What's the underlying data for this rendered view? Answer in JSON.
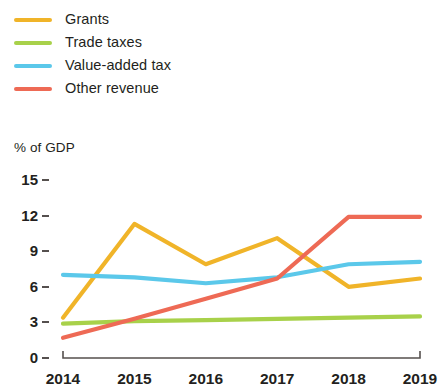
{
  "legend": {
    "position": "top-left",
    "items": [
      {
        "label": "Grants",
        "color": "#f0b429",
        "key": "grants"
      },
      {
        "label": "Trade taxes",
        "color": "#a8d14a",
        "key": "trade_taxes"
      },
      {
        "label": "Value-added tax",
        "color": "#5bc8ea",
        "key": "vat"
      },
      {
        "label": "Other revenue",
        "color": "#ee6a55",
        "key": "other_revenue"
      }
    ]
  },
  "axis": {
    "y_title": "% of GDP",
    "y_ticks": [
      "15",
      "12",
      "9",
      "6",
      "3",
      "0"
    ],
    "x_ticks": [
      "2014",
      "2015",
      "2016",
      "2017",
      "2018",
      "2019"
    ]
  },
  "chart_data": {
    "type": "line",
    "title": "",
    "subtitle": "",
    "xlabel": "",
    "ylabel": "% of GDP",
    "x": [
      "2014",
      "2015",
      "2016",
      "2017",
      "2018",
      "2019"
    ],
    "categories": [
      "2014",
      "2015",
      "2016",
      "2017",
      "2018",
      "2019"
    ],
    "ylim": [
      0,
      15
    ],
    "ytick_values": [
      0,
      3,
      6,
      9,
      12,
      15
    ],
    "grid": false,
    "legend_position": "top-left",
    "series": [
      {
        "name": "Grants",
        "color": "#f0b429",
        "values": [
          3.4,
          11.3,
          7.9,
          10.1,
          6.0,
          6.7
        ]
      },
      {
        "name": "Trade taxes",
        "color": "#a8d14a",
        "values": [
          2.9,
          3.1,
          3.2,
          3.3,
          3.4,
          3.5
        ]
      },
      {
        "name": "Value-added tax",
        "color": "#5bc8ea",
        "values": [
          7.0,
          6.8,
          6.3,
          6.8,
          7.9,
          8.1
        ]
      },
      {
        "name": "Other revenue",
        "color": "#ee6a55",
        "values": [
          1.7,
          3.3,
          5.0,
          6.7,
          11.9,
          11.9
        ]
      }
    ]
  },
  "geometry": {
    "plot_left": 63,
    "plot_right": 420,
    "y0_px": 358,
    "y15_px": 180
  }
}
